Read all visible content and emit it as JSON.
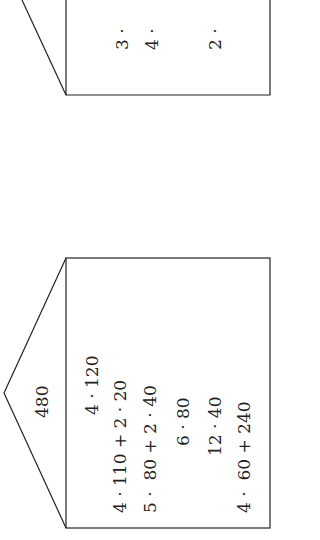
{
  "upper_house": {
    "visible_fragments": [
      "3 ·",
      "4 ·",
      "2 ·"
    ]
  },
  "lower_house": {
    "roof_value": "480",
    "lines": [
      "4 · 120",
      "4 · 110 + 2 · 20",
      "5 ·  80 + 2 · 40",
      "6 · 80",
      "12 · 40",
      "4 ·  60 + 240"
    ]
  },
  "colors": {
    "stroke": "#222222",
    "background": "#ffffff"
  }
}
